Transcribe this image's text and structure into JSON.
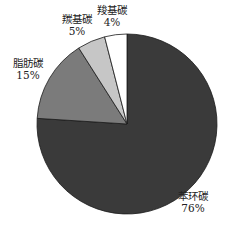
{
  "chart_data": {
    "type": "pie",
    "title": "",
    "start_angle_deg": 90,
    "direction": "clockwise",
    "categories": [
      "苯环碳",
      "脂肪碳",
      "羰基碳",
      "羧基碳"
    ],
    "values": [
      76,
      15,
      5,
      4
    ],
    "labels": [
      "76%",
      "15%",
      "5%",
      "4%"
    ],
    "colors": [
      "#3a3a3a",
      "#7b7b7b",
      "#c6c6c6",
      "#ffffff"
    ],
    "legend": "none",
    "annotations": "category name and percentage labels placed outside slices"
  },
  "slices": [
    {
      "name": "苯环碳",
      "pct": "76%",
      "color": "#3a3a3a"
    },
    {
      "name": "脂肪碳",
      "pct": "15%",
      "color": "#7b7b7b"
    },
    {
      "name": "羰基碳",
      "pct": "5%",
      "color": "#c6c6c6"
    },
    {
      "name": "羧基碳",
      "pct": "4%",
      "color": "#ffffff"
    }
  ]
}
